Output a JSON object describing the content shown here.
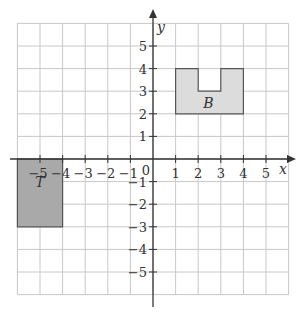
{
  "diagram": {
    "x_axis_label": "x",
    "y_axis_label": "y",
    "origin_label": "0",
    "x_ticks": [
      "−5",
      "−4",
      "−3",
      "−2",
      "−1",
      "1",
      "2",
      "3",
      "4",
      "5"
    ],
    "y_ticks": [
      "5",
      "4",
      "3",
      "2",
      "1",
      "−1",
      "−2",
      "−3",
      "−4",
      "−5"
    ],
    "grid_range": {
      "x": [
        -6,
        6
      ],
      "y": [
        -6,
        6
      ]
    },
    "shapes": [
      {
        "name": "T",
        "label": "T",
        "fill": "#a9a9a9",
        "vertices": [
          [
            -6,
            0
          ],
          [
            -4,
            0
          ],
          [
            -4,
            -3
          ],
          [
            -6,
            -3
          ]
        ]
      },
      {
        "name": "B",
        "label": "B",
        "fill": "#dcdcdc",
        "vertices": [
          [
            1,
            2
          ],
          [
            4,
            2
          ],
          [
            4,
            4
          ],
          [
            3,
            4
          ],
          [
            3,
            3
          ],
          [
            2,
            3
          ],
          [
            2,
            4
          ],
          [
            1,
            4
          ]
        ]
      }
    ]
  }
}
